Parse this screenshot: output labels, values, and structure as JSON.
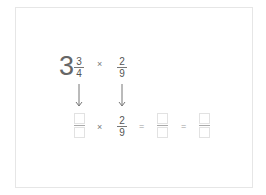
{
  "problem": {
    "row1": {
      "mixed_whole": "3",
      "mixed_numerator": "3",
      "mixed_denominator": "4",
      "operator": "×",
      "fraction_numerator": "2",
      "fraction_denominator": "9"
    },
    "row2": {
      "box1": {
        "numerator": "",
        "denominator": ""
      },
      "operator": "×",
      "fraction_numerator": "2",
      "fraction_denominator": "9",
      "equals1": "=",
      "box2": {
        "numerator": "",
        "denominator": ""
      },
      "equals2": "=",
      "box3": {
        "numerator": "",
        "denominator": ""
      }
    },
    "arrows": [
      "down-arrow",
      "down-arrow"
    ]
  }
}
